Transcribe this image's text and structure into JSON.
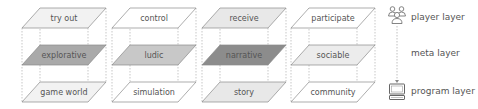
{
  "diagram": {
    "type": "layered-plane-model",
    "columns": [
      {
        "id": "explorative",
        "layers": {
          "player": {
            "label": "try out",
            "fill": "#f2f2f2"
          },
          "meta": {
            "label": "explorative",
            "fill": "#a9a9a9"
          },
          "program": {
            "label": "game world",
            "fill": "#f2f2f2"
          }
        }
      },
      {
        "id": "ludic",
        "layers": {
          "player": {
            "label": "control",
            "fill": "#ffffff"
          },
          "meta": {
            "label": "ludic",
            "fill": "#c8c8c8"
          },
          "program": {
            "label": "simulation",
            "fill": "#ffffff"
          }
        }
      },
      {
        "id": "narrative",
        "layers": {
          "player": {
            "label": "receive",
            "fill": "#e8e8e8"
          },
          "meta": {
            "label": "narrative",
            "fill": "#8c8c8c"
          },
          "program": {
            "label": "story",
            "fill": "#e8e8e8"
          }
        }
      },
      {
        "id": "sociable",
        "layers": {
          "player": {
            "label": "participate",
            "fill": "#ffffff"
          },
          "meta": {
            "label": "sociable",
            "fill": "#ececec"
          },
          "program": {
            "label": "community",
            "fill": "#ffffff"
          }
        }
      }
    ],
    "legend": {
      "player": {
        "label": "player layer",
        "icon": "people-group-icon"
      },
      "meta": {
        "label": "meta layer"
      },
      "program": {
        "label": "program layer",
        "icon": "computer-icon"
      }
    },
    "colors": {
      "stroke": "#8a8a8a",
      "dashed": "#b0b0b0",
      "text": "#555555"
    }
  }
}
